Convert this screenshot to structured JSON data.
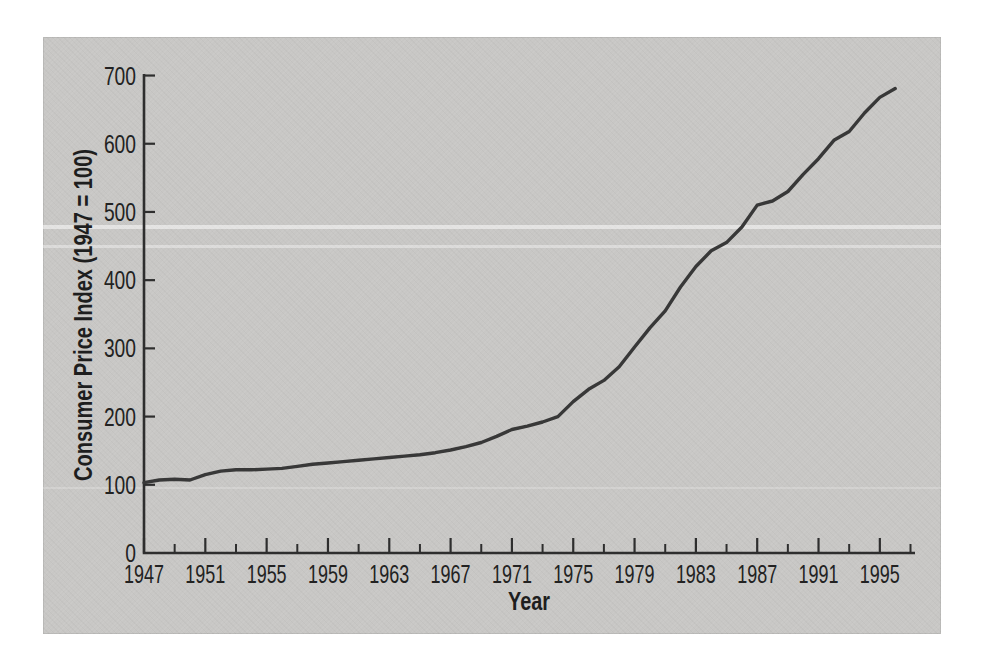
{
  "figure": {
    "background": "#ffffff",
    "panel_color": "#c8c7c5",
    "axis_color": "#2e2e2e",
    "line_color": "#383838",
    "text_color": "#222222"
  },
  "chart_data": {
    "type": "line",
    "title": "",
    "xlabel": "Year",
    "ylabel": "Consumer Price Index (1947 = 100)",
    "xlim": [
      1947,
      1997.6
    ],
    "ylim": [
      0,
      700
    ],
    "grid": "off",
    "legend": "none",
    "x_tick_labels": [
      "1947",
      "1951",
      "1955",
      "1959",
      "1963",
      "1967",
      "1971",
      "1975",
      "1979",
      "1983",
      "1987",
      "1991",
      "1995"
    ],
    "x_minor_ticks": [
      1949,
      1953,
      1957,
      1961,
      1965,
      1969,
      1973,
      1977,
      1981,
      1985,
      1989,
      1993,
      1997
    ],
    "y_tick_labels": [
      "0",
      "100",
      "200",
      "300",
      "400",
      "500",
      "600",
      "700"
    ],
    "series": [
      {
        "name": "Consumer Price Index (1947 = 100)",
        "x": [
          1947,
          1948,
          1949,
          1950,
          1951,
          1952,
          1953,
          1954,
          1955,
          1956,
          1957,
          1958,
          1959,
          1960,
          1961,
          1962,
          1963,
          1964,
          1965,
          1966,
          1967,
          1968,
          1969,
          1970,
          1971,
          1972,
          1973,
          1974,
          1975,
          1976,
          1977,
          1978,
          1979,
          1980,
          1981,
          1982,
          1983,
          1984,
          1985,
          1986,
          1987,
          1988,
          1989,
          1990,
          1991,
          1992,
          1993,
          1994,
          1995,
          1996
        ],
        "values": [
          103,
          107,
          108,
          107,
          115,
          120,
          122,
          122,
          123,
          124,
          127,
          130,
          132,
          134,
          136,
          138,
          140,
          142,
          144,
          147,
          151,
          156,
          162,
          171,
          181,
          186,
          192,
          200,
          222,
          240,
          253,
          273,
          302,
          330,
          355,
          390,
          420,
          443,
          455,
          478,
          510,
          516,
          530,
          555,
          578,
          605,
          618,
          645,
          668,
          681
        ]
      }
    ]
  }
}
